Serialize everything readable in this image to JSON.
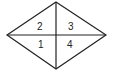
{
  "diagram": {
    "shape": "rhombus",
    "vertices": {
      "top": [
        56,
        2
      ],
      "left": [
        7,
        35
      ],
      "right": [
        106,
        35
      ],
      "bottom": [
        56,
        69
      ]
    },
    "regions": [
      {
        "label": "2",
        "position": "upper-left"
      },
      {
        "label": "3",
        "position": "upper-right"
      },
      {
        "label": "1",
        "position": "lower-left"
      },
      {
        "label": "4",
        "position": "lower-right"
      }
    ],
    "stroke_color": "#222222"
  }
}
